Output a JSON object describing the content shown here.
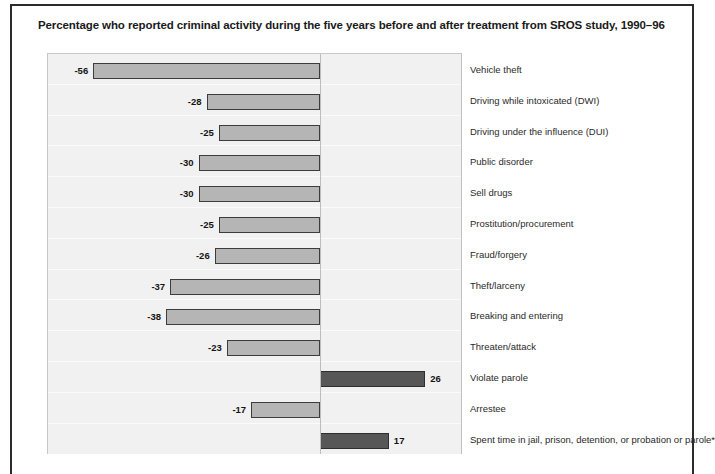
{
  "figure": {
    "title": "Percentage who reported criminal activity during the five years before and after treatment from SROS study, 1990–96"
  },
  "chart_data": {
    "type": "bar",
    "orientation": "horizontal",
    "title": "Percentage who reported criminal activity during the five years before and after treatment from SROS study, 1990–96",
    "xlabel": "",
    "ylabel": "",
    "xlim": [
      -60,
      28
    ],
    "grid": true,
    "legend": null,
    "value_labels_shown": true,
    "note": "Bars extend left (negative, light gray) or right (positive, dark gray) from a zero axis; category labels are listed to the right of the plot.",
    "colors": {
      "negative_bar_fill": "#b5b5b5",
      "negative_bar_border": "#3c3c3c",
      "positive_bar_fill": "#575757",
      "positive_bar_border": "#2e2e2e",
      "plot_background": "#f1f1f1",
      "zero_axis": "#bdbdbd",
      "frame": "#2b2b2b"
    },
    "categories": [
      "Vehicle theft",
      "Driving while intoxicated (DWI)",
      "Driving under the influence (DUI)",
      "Public disorder",
      "Sell drugs",
      "Prostitution/procurement",
      "Fraud/forgery",
      "Theft/larceny",
      "Breaking and entering",
      "Threaten/attack",
      "Violate parole",
      "Arrestee",
      "Spent time in jail, prison, detention, or probation or parole*"
    ],
    "values": [
      -56,
      -28,
      -25,
      -30,
      -30,
      -25,
      -26,
      -37,
      -38,
      -23,
      26,
      -17,
      17
    ],
    "value_labels": [
      "-56",
      "-28",
      "-25",
      "-30",
      "-30",
      "-25",
      "-26",
      "-37",
      "-38",
      "-23",
      "26",
      "-17",
      "17"
    ]
  }
}
